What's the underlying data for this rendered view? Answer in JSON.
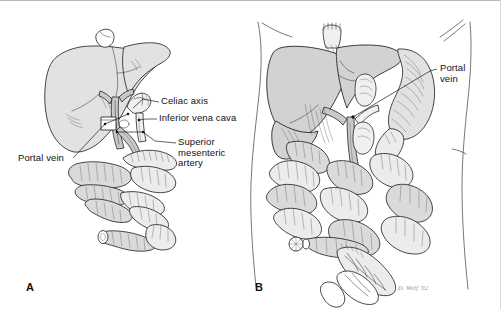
{
  "figure": {
    "caption_letters": {
      "panel_a": "A",
      "panel_b": "B"
    },
    "artist_signature": "D. Wolf '02"
  },
  "panel_a": {
    "letter": "A",
    "labels": [
      {
        "id": "celiac-axis",
        "text": "Celiac axis"
      },
      {
        "id": "inferior-vena-cava",
        "text": "Inferior vena cava"
      },
      {
        "id": "superior-mesenteric-artery",
        "text": "Superior\nmesenteric\nartery"
      },
      {
        "id": "portal-vein",
        "text": "Portal vein"
      }
    ],
    "structures": [
      "liver",
      "portal-vein",
      "celiac-axis",
      "inferior-vena-cava",
      "superior-mesenteric-artery",
      "small-bowel",
      "duodenum"
    ]
  },
  "panel_b": {
    "letter": "B",
    "labels": [
      {
        "id": "portal-vein",
        "text": "Portal\nvein"
      }
    ],
    "structures": [
      "body-outline",
      "diaphragm",
      "liver",
      "stomach",
      "portal-vein",
      "small-bowel",
      "transverse-colon",
      "sigmoid-colon",
      "spleen"
    ]
  },
  "colors": {
    "background": "#ffffff",
    "ink": "#1b1b1b",
    "organ_fill": "#d2d2d2",
    "gut_fill": "#dadada",
    "vessel_fill": "#c9c9c9",
    "body_outline": "#4a4a4a",
    "border": "#b9b9b9"
  }
}
